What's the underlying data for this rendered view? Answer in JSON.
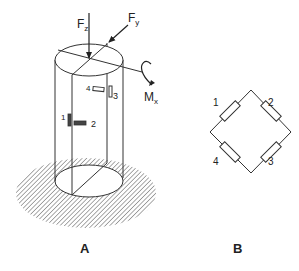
{
  "figure_a": {
    "label": "A",
    "forces": {
      "fz": {
        "main": "F",
        "sub": "z"
      },
      "fy": {
        "main": "F",
        "sub": "y"
      },
      "mx": {
        "main": "M",
        "sub": "x"
      }
    },
    "gauges": [
      {
        "id": "1",
        "label": "1"
      },
      {
        "id": "2",
        "label": "2"
      },
      {
        "id": "3",
        "label": "3"
      },
      {
        "id": "4",
        "label": "4"
      }
    ]
  },
  "figure_b": {
    "label": "B",
    "resistors": [
      {
        "label": "1"
      },
      {
        "label": "2"
      },
      {
        "label": "3"
      },
      {
        "label": "4"
      }
    ]
  },
  "colors": {
    "line": "#333333",
    "gauge_fill": "#444444",
    "hatch": "#555555"
  }
}
